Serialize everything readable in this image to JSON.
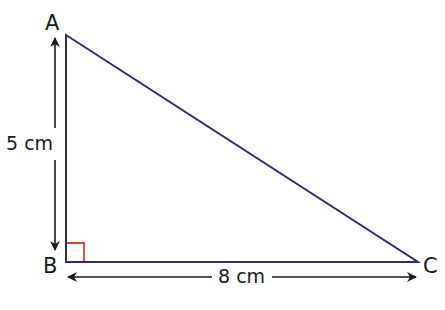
{
  "diagram": {
    "title": "",
    "type": "right-triangle",
    "vertices": [
      {
        "name": "A",
        "x": 66,
        "y": 35
      },
      {
        "name": "B",
        "x": 66,
        "y": 262
      },
      {
        "name": "C",
        "x": 418,
        "y": 262
      }
    ],
    "labels": {
      "A": "A",
      "B": "B",
      "C": "C",
      "side_AB": "5 cm",
      "side_BC": "8 cm"
    },
    "right_angle_at": "B",
    "colors": {
      "triangle_stroke": "#2e2a78",
      "right_angle_marker": "#d9452b",
      "arrow": "#1a1a1a",
      "text": "#1a1a1a",
      "background": "#ffffff"
    }
  }
}
